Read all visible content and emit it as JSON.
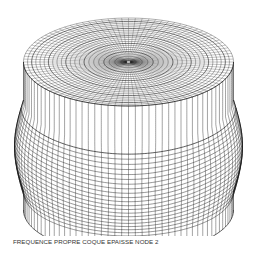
{
  "figure": {
    "mesh_color": "#1a1a1a",
    "background": "#ffffff"
  },
  "caption": {
    "text": "FREQUENCE PROPRE COQUE EPAISSE NODE 2"
  }
}
